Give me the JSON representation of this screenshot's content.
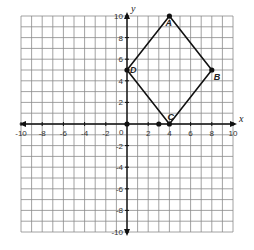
{
  "diagram": {
    "type": "coordinate-grid",
    "x_axis_label": "x",
    "y_axis_label": "y",
    "x_range": [
      -10,
      10
    ],
    "y_range": [
      -10,
      10
    ],
    "grid_step": 1,
    "x_tick_labels": [
      "-10",
      "-8",
      "-6",
      "-4",
      "-2",
      "2",
      "4",
      "6",
      "8",
      "10"
    ],
    "x_tick_values": [
      -10,
      -8,
      -6,
      -4,
      -2,
      2,
      4,
      6,
      8,
      10
    ],
    "y_tick_labels": [
      "10",
      "8",
      "6",
      "4",
      "2",
      "-2",
      "-4",
      "-6",
      "-8",
      "-10"
    ],
    "y_tick_values": [
      10,
      8,
      6,
      4,
      2,
      -2,
      -4,
      -6,
      -8,
      -10
    ],
    "origin_label": "0",
    "polygon": {
      "name": "ABCD",
      "vertices": [
        {
          "label": "A",
          "x": 4,
          "y": 10
        },
        {
          "label": "B",
          "x": 8,
          "y": 5
        },
        {
          "label": "C",
          "x": 4,
          "y": 0
        },
        {
          "label": "D",
          "x": 0,
          "y": 5
        }
      ]
    },
    "extra_points": [
      {
        "x": 0,
        "y": 0
      },
      {
        "x": 3,
        "y": 0
      }
    ],
    "colors": {
      "grid": "#8a8a8a",
      "axis": "#111111",
      "polygon": "#111111",
      "background": "#ffffff"
    }
  }
}
